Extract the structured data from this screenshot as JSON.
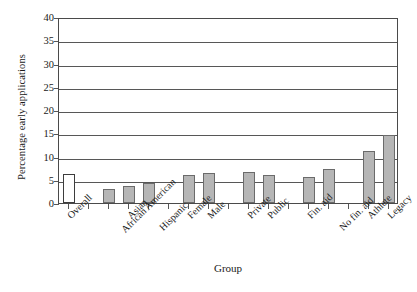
{
  "chart_data": {
    "type": "bar",
    "title": "",
    "xlabel": "Group",
    "ylabel": "Percentage early applications",
    "ylim": [
      0,
      40
    ],
    "ytick_step": 5,
    "yticks": [
      40,
      35,
      30,
      25,
      20,
      15,
      10,
      5,
      0
    ],
    "grid": "horizontal",
    "legend": "none",
    "categories": [
      "Overall",
      "African American",
      "Asian",
      "Hispanic",
      "Female",
      "Male",
      "Private",
      "Public",
      "Fin. aid",
      "No fin. aid",
      "Athlete",
      "Legacy"
    ],
    "values": [
      6.2,
      3.1,
      3.7,
      4.2,
      6.1,
      6.4,
      6.6,
      6.1,
      5.7,
      7.4,
      11.2,
      14.6
    ],
    "bar_styles": [
      "hollow",
      "filled",
      "filled",
      "filled",
      "filled",
      "filled",
      "filled",
      "filled",
      "filled",
      "filled",
      "filled",
      "filled"
    ],
    "group_breaks_after": [
      "Overall",
      "Hispanic",
      "Male",
      "Public",
      "No fin. aid"
    ],
    "colors": {
      "bar_fill": "#b6b6b6",
      "bar_edge": "#6b6b6b",
      "hollow_fill": "#ffffff",
      "hollow_edge": "#3d3d3d",
      "grid": "#575757",
      "frame": "#4a4a4a",
      "text": "#1a1a1a",
      "background": "#ffffff"
    }
  }
}
